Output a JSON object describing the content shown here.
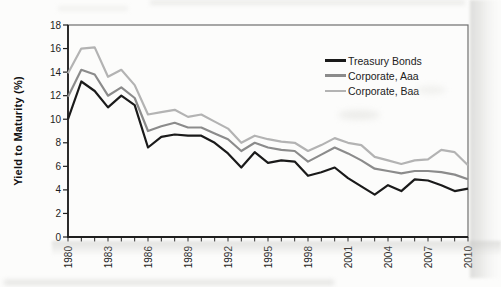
{
  "figure": {
    "kind": "scanned textbook line chart",
    "title": "",
    "background_color": "#fcfcfb",
    "frame_color": "#6e6e6e",
    "axis_color": "#1f1f1f"
  },
  "legend": {
    "position": "upper right inside plot",
    "items": [
      "Treasury Bonds",
      "Corporate, Aaa",
      "Corporate, Baa"
    ]
  },
  "chart_data": {
    "type": "line",
    "title": "",
    "xlabel": "",
    "ylabel": "Yield to Maturity (%)",
    "xlim": [
      1980,
      2010
    ],
    "ylim": [
      0,
      18
    ],
    "grid": false,
    "legend_position": "upper right",
    "y_ticks": [
      0,
      2,
      4,
      6,
      8,
      10,
      12,
      14,
      16,
      18
    ],
    "x_labeled_ticks": [
      1980,
      1983,
      1986,
      1989,
      1992,
      1995,
      1998,
      2001,
      2004,
      2007,
      2010
    ],
    "x": [
      1980,
      1981,
      1982,
      1983,
      1984,
      1985,
      1986,
      1987,
      1988,
      1989,
      1990,
      1991,
      1992,
      1993,
      1994,
      1995,
      1996,
      1997,
      1998,
      1999,
      2000,
      2001,
      2002,
      2003,
      2004,
      2005,
      2006,
      2007,
      2008,
      2009,
      2010
    ],
    "series": [
      {
        "name": "Treasury Bonds",
        "color": "#1a1a1a",
        "values": [
          10.0,
          13.2,
          12.4,
          11.0,
          12.0,
          11.2,
          7.6,
          8.5,
          8.7,
          8.6,
          8.6,
          8.0,
          7.1,
          5.9,
          7.2,
          6.3,
          6.5,
          6.4,
          5.2,
          5.5,
          5.9,
          5.0,
          4.3,
          3.6,
          4.4,
          3.9,
          4.9,
          4.8,
          4.4,
          3.9,
          4.1
        ]
      },
      {
        "name": "Corporate, Aaa",
        "color": "#8b8b8b",
        "values": [
          11.9,
          14.2,
          13.8,
          12.0,
          12.7,
          11.8,
          9.0,
          9.4,
          9.7,
          9.3,
          9.3,
          8.8,
          8.3,
          7.3,
          8.0,
          7.6,
          7.4,
          7.3,
          6.4,
          7.0,
          7.6,
          7.1,
          6.5,
          5.8,
          5.6,
          5.4,
          5.6,
          5.6,
          5.5,
          5.3,
          4.9
        ]
      },
      {
        "name": "Corporate, Baa",
        "color": "#b3b3b3",
        "values": [
          13.9,
          16.0,
          16.1,
          13.6,
          14.2,
          12.9,
          10.4,
          10.6,
          10.8,
          10.2,
          10.4,
          9.8,
          9.2,
          8.0,
          8.6,
          8.3,
          8.1,
          8.0,
          7.3,
          7.8,
          8.4,
          8.0,
          7.8,
          6.8,
          6.5,
          6.2,
          6.5,
          6.6,
          7.4,
          7.2,
          6.1
        ]
      }
    ]
  }
}
